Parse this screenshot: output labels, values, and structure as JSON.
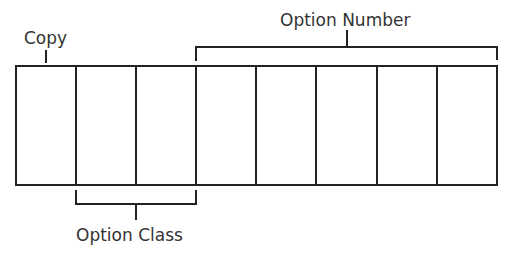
{
  "diagram": {
    "labels": {
      "copy": "Copy",
      "option_number": "Option Number",
      "option_class": "Option Class"
    },
    "cells": {
      "count": 8,
      "groups": [
        {
          "name": "Copy",
          "cells": [
            1
          ]
        },
        {
          "name": "Option Class",
          "cells": [
            2,
            3
          ]
        },
        {
          "name": "Option Number",
          "cells": [
            4,
            5,
            6,
            7,
            8
          ]
        }
      ]
    },
    "colors": {
      "stroke": "#222222",
      "text": "#333333",
      "background": "#ffffff"
    }
  }
}
